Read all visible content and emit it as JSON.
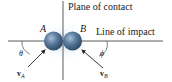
{
  "labels": {
    "plane": "Plane of contact",
    "line": "Line of impact",
    "ballA": "A",
    "ballB": "B",
    "theta": "θ",
    "phi": "ϕ",
    "vA": "v",
    "vA_sub": "A",
    "vB": "v",
    "vB_sub": "B"
  },
  "colors": {
    "line": "#333333",
    "ball": "#4a6a8c",
    "ball_highlight": "#a9c0d8",
    "glow": "#bcd6f0"
  }
}
